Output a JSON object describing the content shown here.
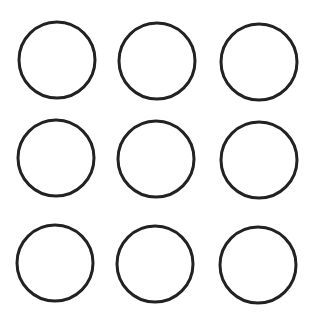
{
  "canvas": {
    "width": 315,
    "height": 322,
    "background": "#ffffff"
  },
  "style": {
    "stroke": "#222222",
    "stroke_width": 3,
    "fill": "none"
  },
  "circles": [
    {
      "row": 1,
      "col": 1,
      "cx": 57,
      "cy": 60,
      "r": 38
    },
    {
      "row": 1,
      "col": 2,
      "cx": 157,
      "cy": 61,
      "r": 38
    },
    {
      "row": 1,
      "col": 3,
      "cx": 259,
      "cy": 62,
      "r": 38
    },
    {
      "row": 2,
      "col": 1,
      "cx": 56,
      "cy": 158,
      "r": 38
    },
    {
      "row": 2,
      "col": 2,
      "cx": 156,
      "cy": 159,
      "r": 38
    },
    {
      "row": 2,
      "col": 3,
      "cx": 259,
      "cy": 160,
      "r": 38
    },
    {
      "row": 3,
      "col": 1,
      "cx": 55,
      "cy": 263,
      "r": 38
    },
    {
      "row": 3,
      "col": 2,
      "cx": 155,
      "cy": 264,
      "r": 38
    },
    {
      "row": 3,
      "col": 3,
      "cx": 258,
      "cy": 265,
      "r": 38
    }
  ]
}
